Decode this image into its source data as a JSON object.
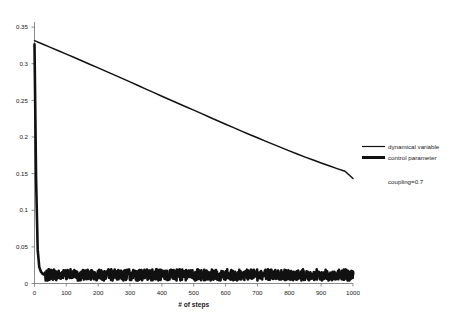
{
  "chart_data": {
    "type": "line",
    "title": "",
    "xlabel": "# of steps",
    "ylabel": "",
    "xlim": [
      0,
      1000
    ],
    "ylim": [
      0,
      0.35
    ],
    "grid": false,
    "legend_position": "right",
    "xticks": [
      0,
      100,
      200,
      300,
      400,
      500,
      600,
      700,
      800,
      900,
      1000
    ],
    "xtick_labels": [
      "0",
      "100",
      "200",
      "300",
      "400",
      "500",
      "600",
      "700",
      "800",
      "900",
      "1000"
    ],
    "yticks": [
      0,
      0.05,
      0.1,
      0.15,
      0.2,
      0.25,
      0.3,
      0.35
    ],
    "ytick_labels": [
      "0",
      "0.05",
      "0.1",
      "0.15",
      "0.2",
      "0.25",
      "0.3",
      "0.35"
    ],
    "annotations": [
      {
        "text": "coupling=0.7",
        "x": 1060,
        "y": 0.168
      }
    ],
    "series": [
      {
        "name": "dynamical variable",
        "style": "thin-line",
        "color": "#111111",
        "x": [
          0,
          25,
          50,
          75,
          100,
          125,
          150,
          175,
          200,
          225,
          250,
          275,
          300,
          325,
          350,
          375,
          400,
          425,
          450,
          475,
          500,
          525,
          550,
          575,
          600,
          625,
          650,
          675,
          700,
          725,
          750,
          775,
          800,
          825,
          850,
          875,
          900,
          925,
          950,
          975,
          1000
        ],
        "values": [
          0.325,
          0.3205,
          0.316,
          0.3115,
          0.307,
          0.3024,
          0.2978,
          0.2932,
          0.2886,
          0.2839,
          0.2792,
          0.2745,
          0.2698,
          0.265,
          0.2602,
          0.2554,
          0.2506,
          0.2459,
          0.2412,
          0.2366,
          0.232,
          0.2273,
          0.2226,
          0.2179,
          0.2132,
          0.2086,
          0.204,
          0.1995,
          0.195,
          0.1906,
          0.1862,
          0.1818,
          0.1775,
          0.1733,
          0.1692,
          0.1652,
          0.1613,
          0.1575,
          0.1538,
          0.1502,
          0.1405
        ]
      },
      {
        "name": "control parameter",
        "style": "thick-line",
        "color": "#111111",
        "description": "initial spike near 0.32 at step 0, rapid collapse, then a narrow noisy band just above zero",
        "spike_peak": 0.32,
        "band_min": 0.004,
        "band_max": 0.019,
        "x": [
          0,
          5,
          10,
          15,
          20,
          25,
          30,
          40,
          50,
          60,
          70,
          80,
          90,
          100,
          150,
          200,
          250,
          300,
          350,
          400,
          450,
          500,
          550,
          600,
          650,
          700,
          750,
          800,
          850,
          900,
          950,
          1000
        ],
        "values": [
          0.32,
          0.14,
          0.045,
          0.022,
          0.016,
          0.013,
          0.012,
          0.0125,
          0.012,
          0.0128,
          0.0118,
          0.0126,
          0.0115,
          0.0122,
          0.0119,
          0.0124,
          0.0117,
          0.0125,
          0.0116,
          0.0123,
          0.0118,
          0.0126,
          0.0115,
          0.0124,
          0.0119,
          0.0122,
          0.0117,
          0.0125,
          0.0118,
          0.0123,
          0.0116,
          0.0121
        ]
      }
    ]
  },
  "legend": {
    "entries": [
      {
        "label": "dynamical variable",
        "marker": "thin-line"
      },
      {
        "label": "control parameter",
        "marker": "thick-line"
      }
    ]
  },
  "annotation": {
    "coupling_text": "coupling=0.7"
  },
  "axes": {
    "x_title": "# of steps"
  }
}
